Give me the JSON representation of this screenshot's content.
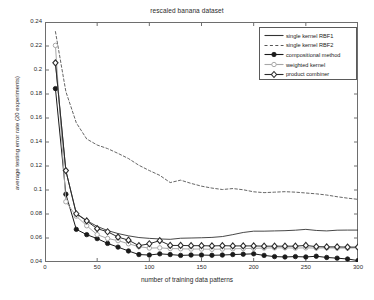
{
  "figure": {
    "title": "rescaled banana dataset",
    "xlabel": "number of training data patterns",
    "ylabel": "average testing error rate (20 experiments)"
  },
  "axes": {
    "xticks": [
      "0",
      "50",
      "100",
      "150",
      "200",
      "250",
      "300"
    ],
    "yticks": [
      "0.04",
      "0.06",
      "0.08",
      "0.1",
      "0.12",
      "0.14",
      "0.16",
      "0.18",
      "0.2",
      "0.22",
      "0.24"
    ]
  },
  "legend": {
    "items": [
      {
        "label": "single kernel RBF1",
        "style": "solid-line",
        "marker": "none",
        "color": "#333333"
      },
      {
        "label": "single kernel RBF2",
        "style": "dashed-line",
        "marker": "none",
        "color": "#555555"
      },
      {
        "label": "compositional method",
        "style": "solid-line",
        "marker": "filled-circle",
        "color": "#1a1a1a"
      },
      {
        "label": "weighted kernel",
        "style": "solid-line",
        "marker": "open-circle",
        "color": "#a8a8a8"
      },
      {
        "label": "product combiner",
        "style": "solid-line",
        "marker": "open-diamond",
        "color": "#2b2b2b"
      }
    ]
  },
  "chart_data": {
    "type": "line",
    "title": "rescaled banana dataset",
    "xlabel": "number of training data patterns",
    "ylabel": "average testing error rate (20 experiments)",
    "xlim": [
      0,
      300
    ],
    "ylim": [
      0.04,
      0.24
    ],
    "xticks": [
      0,
      50,
      100,
      150,
      200,
      250,
      300
    ],
    "yticks": [
      0.04,
      0.06,
      0.08,
      0.1,
      0.12,
      0.14,
      0.16,
      0.18,
      0.2,
      0.22,
      0.24
    ],
    "grid": false,
    "legend_position": "upper-right",
    "x": [
      10,
      20,
      30,
      40,
      50,
      60,
      70,
      80,
      90,
      100,
      110,
      120,
      130,
      140,
      150,
      160,
      170,
      180,
      190,
      200,
      210,
      220,
      230,
      240,
      250,
      260,
      270,
      280,
      290,
      300
    ],
    "series": [
      {
        "name": "single kernel RBF1",
        "style": "solid",
        "marker": "none",
        "color": "#333333",
        "values": [
          0.206,
          0.116,
          0.0805,
          0.0745,
          0.0697,
          0.0662,
          0.0637,
          0.0618,
          0.0604,
          0.0597,
          0.0592,
          0.0589,
          0.0598,
          0.06,
          0.0602,
          0.0605,
          0.0612,
          0.0628,
          0.0646,
          0.0657,
          0.0657,
          0.0659,
          0.0661,
          0.0665,
          0.0672,
          0.0663,
          0.0659,
          0.0665,
          0.0666,
          0.0666
        ]
      },
      {
        "name": "single kernel RBF2",
        "style": "dashed",
        "marker": "none",
        "color": "#555555",
        "values": [
          0.232,
          0.182,
          0.156,
          0.1425,
          0.1375,
          0.1345,
          0.1305,
          0.1262,
          0.1206,
          0.1162,
          0.1122,
          0.1062,
          0.1082,
          0.1055,
          0.1032,
          0.1016,
          0.1004,
          0.1012,
          0.1002,
          0.0985,
          0.0978,
          0.0982,
          0.0986,
          0.0982,
          0.0975,
          0.0968,
          0.0958,
          0.0944,
          0.0932,
          0.0922
        ]
      },
      {
        "name": "compositional method",
        "style": "solid",
        "marker": "filled-circle",
        "color": "#1a1a1a",
        "values": [
          0.1845,
          0.0965,
          0.0672,
          0.0628,
          0.0595,
          0.0555,
          0.0524,
          0.0492,
          0.0462,
          0.0458,
          0.0468,
          0.0462,
          0.0455,
          0.0458,
          0.0458,
          0.0456,
          0.0458,
          0.0462,
          0.0465,
          0.0468,
          0.0455,
          0.0445,
          0.0442,
          0.0445,
          0.0442,
          0.0448,
          0.0438,
          0.0432,
          0.0425,
          0.0412
        ]
      },
      {
        "name": "weighted kernel",
        "style": "solid",
        "marker": "open-circle",
        "color": "#a8a8a8",
        "values": [
          0.2205,
          0.0902,
          0.0782,
          0.0702,
          0.0628,
          0.0596,
          0.0578,
          0.0552,
          0.0528,
          0.0516,
          0.0518,
          0.0512,
          0.051,
          0.0508,
          0.0508,
          0.0506,
          0.0508,
          0.051,
          0.0512,
          0.0514,
          0.0516,
          0.0518,
          0.0518,
          0.0516,
          0.0518,
          0.0516,
          0.0518,
          0.0516,
          0.0516,
          0.0518
        ]
      },
      {
        "name": "product combiner",
        "style": "solid",
        "marker": "open-diamond",
        "color": "#2b2b2b",
        "values": [
          0.206,
          0.1162,
          0.0802,
          0.0742,
          0.0678,
          0.0652,
          0.0608,
          0.0582,
          0.0536,
          0.0552,
          0.0578,
          0.0538,
          0.0538,
          0.0536,
          0.0536,
          0.0534,
          0.0536,
          0.0534,
          0.0534,
          0.0534,
          0.0532,
          0.0532,
          0.0532,
          0.0532,
          0.0538,
          0.0528,
          0.0526,
          0.0526,
          0.0524,
          0.0524
        ]
      }
    ]
  }
}
